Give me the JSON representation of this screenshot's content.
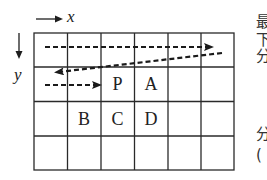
{
  "diagram": {
    "type": "grid-scan-order",
    "grid": {
      "rows": 4,
      "cols": 6,
      "origin": [
        34,
        33
      ],
      "cell_width": 33.3,
      "cell_height": 34.25,
      "line_color": "#2a2a2a"
    },
    "axes": {
      "x_label": "x",
      "y_label": "y"
    },
    "cells": [
      {
        "label": "P",
        "row": 1,
        "col": 2
      },
      {
        "label": "A",
        "row": 1,
        "col": 3
      },
      {
        "label": "B",
        "row": 2,
        "col": 1
      },
      {
        "label": "C",
        "row": 2,
        "col": 2
      },
      {
        "label": "D",
        "row": 2,
        "col": 3
      }
    ],
    "scan_arrows": [
      {
        "name": "row-1-left-to-right",
        "from": [
          45,
          47
        ],
        "to": [
          218,
          47
        ]
      },
      {
        "name": "return-diagonal",
        "from": [
          222,
          53
        ],
        "to": [
          50,
          73
        ]
      },
      {
        "name": "row-2-left-to-right",
        "from": [
          45,
          85
        ],
        "to": [
          107,
          85
        ]
      }
    ],
    "side_text_fragments": [
      {
        "text": "最",
        "y": 15
      },
      {
        "text": "下",
        "y": 33
      },
      {
        "text": "分",
        "y": 49
      },
      {
        "text": "分",
        "y": 127
      },
      {
        "text": "(",
        "y": 148
      }
    ]
  }
}
